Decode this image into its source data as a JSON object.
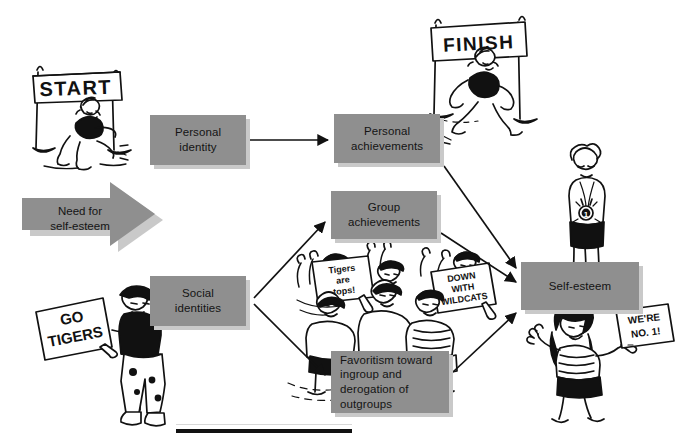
{
  "diagram": {
    "box_fill": "#8f8f8f",
    "box_shadow": "#c9c9c9",
    "ink": "#111111",
    "driver": {
      "label": "Need for\nself-esteem",
      "line1": "Need for",
      "line2": "self-esteem",
      "shape": "block-arrow-right"
    },
    "nodes": [
      {
        "id": "personal-identity",
        "line1": "Personal",
        "line2": "identity",
        "align": "center"
      },
      {
        "id": "personal-achievements",
        "line1": "Personal",
        "line2": "achievements",
        "align": "center"
      },
      {
        "id": "group-achievements",
        "line1": "Group",
        "line2": "achievements",
        "align": "center"
      },
      {
        "id": "social-identities",
        "line1": "Social",
        "line2": "identities",
        "align": "center"
      },
      {
        "id": "favoritism",
        "line1": "Favoritism toward",
        "line2": "ingroup and",
        "line3": "derogation of",
        "line4": "outgroups",
        "align": "left"
      },
      {
        "id": "self-esteem",
        "line1": "Self-esteem",
        "line2": "",
        "align": "center"
      }
    ],
    "edges": [
      {
        "from": "need-for-self-esteem",
        "to": "personal-identity",
        "style": "block-arrow"
      },
      {
        "from": "need-for-self-esteem",
        "to": "social-identities",
        "style": "block-arrow"
      },
      {
        "from": "personal-identity",
        "to": "personal-achievements",
        "style": "arrow-right"
      },
      {
        "from": "social-identities",
        "to": "group-achievements",
        "style": "arrow-diagonal-up"
      },
      {
        "from": "social-identities",
        "to": "favoritism",
        "style": "arrow-diagonal-down"
      },
      {
        "from": "personal-achievements",
        "to": "self-esteem",
        "style": "arrow-diagonal-down"
      },
      {
        "from": "group-achievements",
        "to": "self-esteem",
        "style": "arrow-diagonal-down"
      },
      {
        "from": "favoritism",
        "to": "self-esteem",
        "style": "arrow-diagonal-up"
      }
    ]
  },
  "illustrations": {
    "start_banner": {
      "text": "START",
      "caption": "runner crouched in starting blocks under a START banner"
    },
    "finish_banner": {
      "text": "FINISH",
      "caption": "runner breaking the tape under a FINISH banner"
    },
    "medalist": {
      "text": "1",
      "caption": "athlete wearing a first-place medal"
    },
    "fan_left": {
      "sign_line1": "GO",
      "sign_line2": "TIGERS",
      "caption": "fan in a cap holding a GO TIGERS sign"
    },
    "crowd": {
      "sign_a_line1": "Tigers",
      "sign_a_line2": "are",
      "sign_a_line3": "tops!",
      "sign_b_line1": "DOWN",
      "sign_b_line2": "WITH",
      "sign_b_line3": "WILDCATS",
      "caption": "cheering crowd holding rival signs"
    },
    "fan_right": {
      "sign_line1": "WE'RE",
      "sign_line2": "NO. 1!",
      "caption": "woman waving while holding a WE'RE NO. 1! sign"
    }
  },
  "footer": {
    "rule": "horizontal rule"
  }
}
